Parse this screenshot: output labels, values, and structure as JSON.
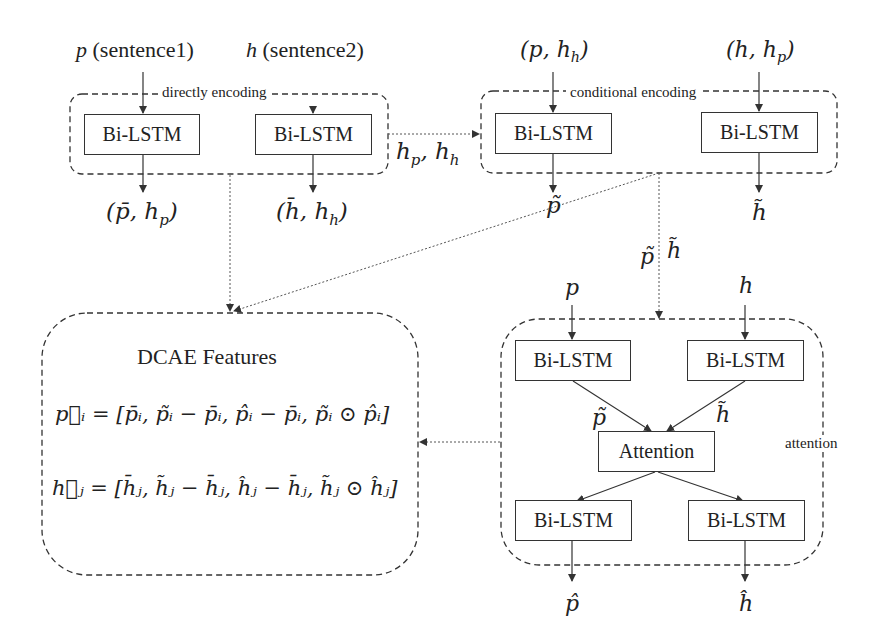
{
  "diagram": {
    "inputs": {
      "p_label": "p",
      "p_desc": "(sentence1)",
      "h_label": "h",
      "h_desc": "(sentence2)",
      "cond_p": "(p, h",
      "cond_p_sub": "h",
      "cond_h": "(h, h",
      "cond_h_sub": "p",
      "close_paren": ")"
    },
    "groups": {
      "direct": "directly encoding",
      "conditional": "conditional encoding",
      "attention": "attention"
    },
    "boxes": {
      "bilstm": "Bi-LSTM",
      "attention": "Attention"
    },
    "outputs": {
      "direct_p": "(p̄, h",
      "direct_p_sub": "p",
      "direct_h": "(h̄, h",
      "direct_h_sub": "h",
      "hidden_states": "h",
      "hidden_sub_p": "p",
      "hidden_sep": ", h",
      "hidden_sub_h": "h",
      "cond_p_tilde": "p̃",
      "cond_h_tilde": "h̃",
      "pass_p_tilde": "p̃",
      "pass_h_tilde": "h̃",
      "att_in_p": "p",
      "att_in_h": "h",
      "att_p_tilde": "p̃",
      "att_h_tilde": "h̃",
      "final_p_hat": "p̂",
      "final_h_hat": "ĥ"
    },
    "features": {
      "title": "DCAE Features",
      "eq_p": "p⃗ᵢ = [p̄ᵢ, p̃ᵢ − p̄ᵢ, p̂ᵢ − p̄ᵢ, p̃ᵢ ⊙ p̂ᵢ]",
      "eq_h": "h⃗ⱼ = [h̄ⱼ, h̃ⱼ − h̄ⱼ, ĥⱼ − h̄ⱼ, h̃ⱼ ⊙ ĥⱼ]"
    }
  }
}
